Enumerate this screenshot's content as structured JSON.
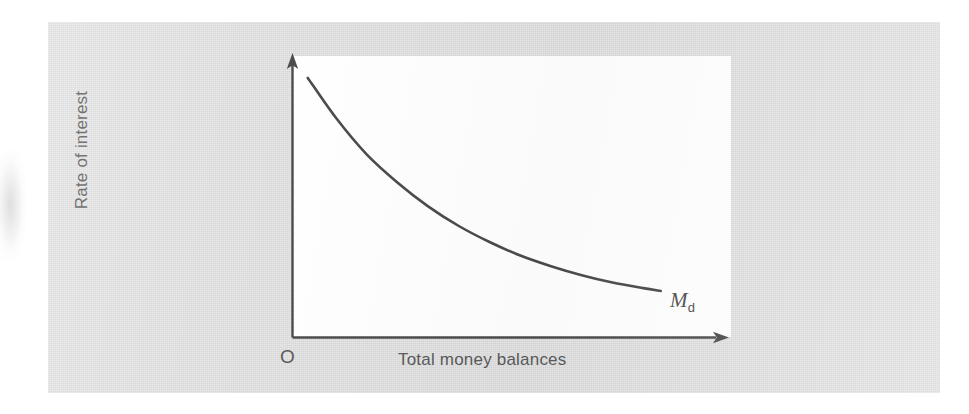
{
  "figure": {
    "background_color": "#dcdcdc",
    "plot_background_color": "#ffffff",
    "ink_color": "#4a4a4a",
    "text_color": "#5a5a5a"
  },
  "labels": {
    "y_axis": "Rate of interest",
    "x_axis": "Total money balances",
    "origin": "O",
    "curve_symbol": "M",
    "curve_subscript": "d",
    "curve_full": "Md"
  },
  "chart_data": {
    "type": "line",
    "title": "",
    "subtitle": "",
    "xlabel": "Total money balances",
    "ylabel": "Rate of interest",
    "xlim": [
      0,
      100
    ],
    "ylim": [
      0,
      100
    ],
    "grid": false,
    "legend": null,
    "axis_ticks": {
      "x": [],
      "y": []
    },
    "origin_label": "O",
    "annotations": [
      {
        "text": "Md",
        "x": 86,
        "y": 13,
        "description": "money demand curve label at the right end of the curve"
      }
    ],
    "series": [
      {
        "name": "Md",
        "description": "Downward-sloping convex money demand (liquidity preference) curve",
        "x": [
          3.6,
          10,
          17,
          24,
          31,
          38,
          45,
          52,
          59,
          66,
          73,
          80,
          84
        ],
        "y": [
          92.2,
          78.0,
          65.0,
          55.0,
          46.5,
          39.5,
          33.8,
          29.0,
          25.2,
          22.0,
          19.4,
          17.4,
          16.4
        ]
      }
    ]
  }
}
